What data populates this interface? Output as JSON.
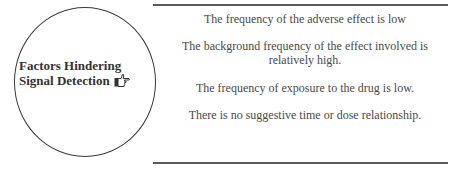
{
  "diagram": {
    "central_node": {
      "line1": "Factors Hindering",
      "line2": "Signal Detection",
      "icon": "pointing-hand-icon"
    },
    "factors": [
      "The frequency of the adverse effect is low",
      "The background frequency of the effect involved is relatively high.",
      "The frequency of exposure to the drug is low.",
      "There is no suggestive time or dose relationship."
    ],
    "colors": {
      "border": "#3a3a3a",
      "rule": "#5a5a5a",
      "label_text": "#333333",
      "item_text": "#4a4a4a"
    }
  }
}
